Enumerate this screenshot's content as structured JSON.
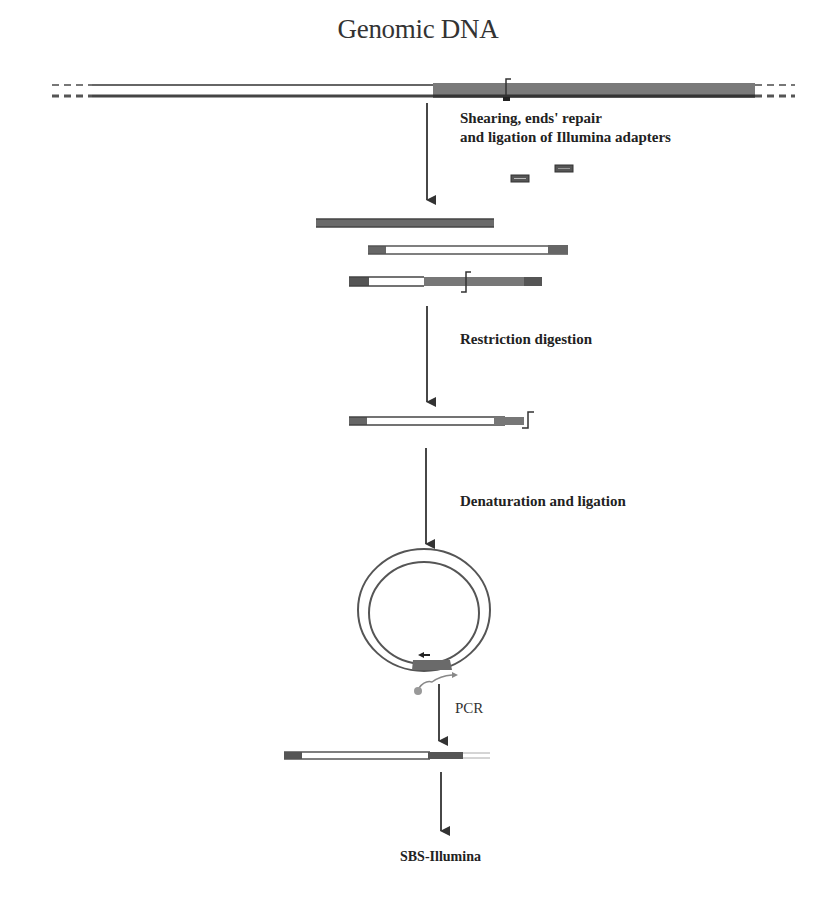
{
  "diagram": {
    "title": "Genomic DNA",
    "steps": [
      {
        "label_line1": "Shearing, ends' repair",
        "label_line2": "and ligation of Illumina adapters"
      },
      {
        "label": "Restriction digestion"
      },
      {
        "label": "Denaturation and ligation"
      },
      {
        "label": "PCR"
      },
      {
        "label": "SBS-Illumina"
      }
    ],
    "elements": {
      "genomic_dna": "double-stranded genomic DNA with dashed continuations and restriction site marker",
      "sheared_fragments": 3,
      "adapters": 2,
      "circularized_fragment": "ligated circle with adapter region and primers"
    },
    "colors": {
      "strand": "#555555",
      "target_region": "#7a7a7a",
      "adapter": "#4a4a4a",
      "primer_dot": "#999999",
      "arrow": "#333333"
    }
  }
}
